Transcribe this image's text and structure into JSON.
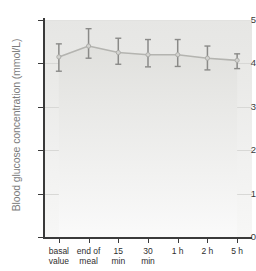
{
  "chart_data": {
    "type": "line",
    "title": "",
    "xlabel": "",
    "ylabel": "Blood glucose concentration (mmol/L)",
    "categories": [
      "basal value",
      "end of meal",
      "15 min",
      "30 min",
      "1 h",
      "2 h",
      "5 h"
    ],
    "values": [
      4.15,
      4.4,
      4.25,
      4.2,
      4.2,
      4.12,
      4.07
    ],
    "error_upper": [
      4.45,
      4.8,
      4.58,
      4.55,
      4.55,
      4.4,
      4.22
    ],
    "error_lower": [
      3.82,
      4.12,
      3.98,
      3.92,
      3.93,
      3.85,
      3.88
    ],
    "ylim": [
      0,
      5
    ],
    "yticks": [
      0,
      1,
      2,
      3,
      4,
      5
    ],
    "ytick_labels": [
      "0",
      "1",
      "2",
      "3",
      "4",
      "5"
    ],
    "grid": true,
    "grid_axis": "y",
    "legend": "none",
    "fill": true,
    "series": [
      {
        "name": "Blood glucose concentration",
        "values": [
          4.15,
          4.4,
          4.25,
          4.2,
          4.2,
          4.12,
          4.07
        ]
      }
    ],
    "colors": {
      "line": "#b4b4b0",
      "fill_top": "#e6e6e4",
      "fill_bottom": "#f7f7f6",
      "error_bar": "#8a8a88",
      "axis": "#3a3a3a",
      "grid": "#d8d8d6",
      "ylabel_text": "#7c7c7c"
    }
  },
  "axes": {
    "y_title": "Blood glucose concentration (mmol/L)",
    "y_ticks": [
      {
        "label": "5",
        "value": 5
      },
      {
        "label": "4",
        "value": 4
      },
      {
        "label": "3",
        "value": 3
      },
      {
        "label": "2",
        "value": 2
      },
      {
        "label": "1",
        "value": 1
      },
      {
        "label": "0",
        "value": 0
      }
    ],
    "x_ticks": [
      {
        "line1": "basal",
        "line2": "value"
      },
      {
        "line1": "end of",
        "line2": "meal"
      },
      {
        "line1": "15",
        "line2": "min"
      },
      {
        "line1": "30",
        "line2": "min"
      },
      {
        "line1": "1 h",
        "line2": ""
      },
      {
        "line1": "2 h",
        "line2": ""
      },
      {
        "line1": "5 h",
        "line2": ""
      }
    ]
  }
}
